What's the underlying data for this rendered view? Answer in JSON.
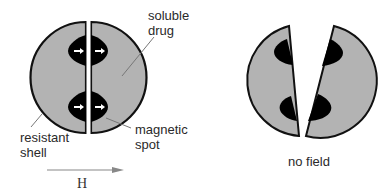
{
  "labels": {
    "soluble_drug": "soluble\ndrug",
    "soluble_line1": "soluble",
    "soluble_line2": "drug",
    "resistant_line1": "resistant",
    "resistant_line2": "shell",
    "magnetic_line1": "magnetic",
    "magnetic_line2": "spot",
    "field": "H",
    "no_field": "no field"
  },
  "colors": {
    "shell_fill": "#b3b3b3",
    "shell_stroke": "#111111",
    "spot_fill": "#000000",
    "arrow": "#ffffff",
    "leader": "#666666"
  }
}
